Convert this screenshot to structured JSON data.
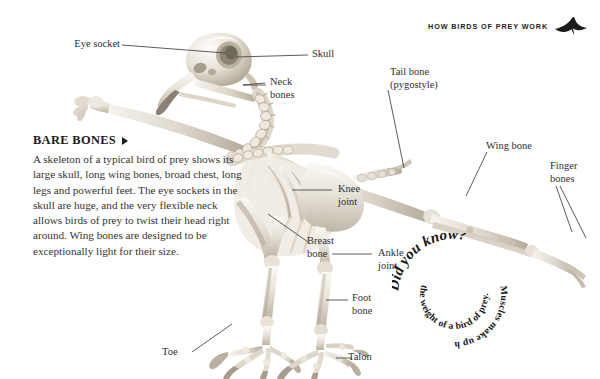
{
  "running_head": {
    "text": "HOW BIRDS OF PREY WORK",
    "icon": "flying-bird-silhouette-icon"
  },
  "figure": {
    "name": "bird-of-prey-skeleton"
  },
  "callouts": [
    {
      "id": "eye-socket",
      "text": "Eye socket"
    },
    {
      "id": "skull",
      "text": "Skull"
    },
    {
      "id": "neck-bones",
      "text": "Neck\nbones"
    },
    {
      "id": "tail-bone",
      "text": "Tail bone\n(pygostyle)"
    },
    {
      "id": "wing-bone",
      "text": "Wing bone"
    },
    {
      "id": "finger-bones",
      "text": "Finger\nbones"
    },
    {
      "id": "knee-joint",
      "text": "Knee\njoint"
    },
    {
      "id": "breast-bone",
      "text": "Breast\nbone"
    },
    {
      "id": "ankle-joint",
      "text": "Ankle\njoint"
    },
    {
      "id": "foot-bone",
      "text": "Foot\nbone"
    },
    {
      "id": "toe",
      "text": "Toe"
    },
    {
      "id": "talon",
      "text": "Talon"
    }
  ],
  "bare_bones": {
    "heading": "BARE BONES",
    "arrow": "right-triangle-icon",
    "body": "A skeleton of a typical bird of prey shows its large skull, long wing bones, broad chest, long legs and powerful feet. The eye sockets in the skull are huge, and the very flexible neck allows birds of prey to twist their head right around. Wing bones are designed to be exceptionally light for their size."
  },
  "did_you_know": {
    "ring_outer": "Did you know?",
    "ring_middle": "Muscles make up half",
    "ring_inner": "the weight of a bird of prey."
  },
  "colors": {
    "background": "#ffffff",
    "text": "#2f2f2f",
    "heading": "#1a1a1a",
    "leader_line": "#4a4a4a",
    "bone_light": "#f2efe9",
    "bone_mid": "#d8d2c6",
    "bone_shadow": "#a99f90"
  }
}
